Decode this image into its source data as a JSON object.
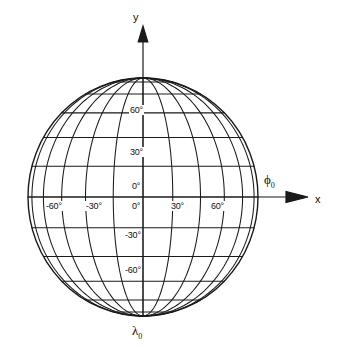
{
  "figure": {
    "title": "",
    "background": "#ffffff",
    "line_color": "#1a1a1a"
  },
  "axes": {
    "x_label": "x",
    "y_label": "y",
    "origin_label": ""
  },
  "symbols": {
    "phi0": "ϕ",
    "phi0_sub": "0",
    "lambda0": "λ",
    "lambda0_sub": "0"
  },
  "meridian_labels": [
    {
      "text": "-60°",
      "value": -60
    },
    {
      "text": "-30°",
      "value": -30
    },
    {
      "text": "0°",
      "value": 0
    },
    {
      "text": "30°",
      "value": 30
    },
    {
      "text": "60°",
      "value": 60
    }
  ],
  "parallel_labels": [
    {
      "text": "60°",
      "value": 60
    },
    {
      "text": "30°",
      "value": 30
    },
    {
      "text": "0°",
      "value": 0
    },
    {
      "text": "-30°",
      "value": -30
    },
    {
      "text": "-60°",
      "value": -60
    }
  ],
  "equator_center_label": "0°",
  "chart_data": {
    "type": "line",
    "xlabel": "x",
    "ylabel": "y",
    "projection": "orthographic",
    "grid": true,
    "legend": false,
    "graticule": {
      "meridian_step_deg": 15,
      "parallel_step_deg": 15,
      "meridian_range_deg": [
        -90,
        90
      ],
      "parallel_range_deg": [
        -90,
        90
      ]
    },
    "center": {
      "x_px": 143,
      "y_px": 197
    },
    "radius": {
      "rx_px": 115,
      "ry_px": 119
    },
    "annotations": [
      {
        "text": "y",
        "x_px": 138,
        "y_px": 18,
        "role": "axis-label"
      },
      {
        "text": "x",
        "x_px": 320,
        "y_px": 200,
        "role": "axis-label"
      },
      {
        "text": "ϕ0",
        "x_px": 268,
        "y_px": 183,
        "role": "central-meridian-longitude"
      },
      {
        "text": "λ0",
        "x_px": 136,
        "y_px": 333,
        "role": "pole-longitude"
      },
      {
        "text": "60°",
        "x_px": 131,
        "y_px": 110,
        "role": "parallel-tick"
      },
      {
        "text": "30°",
        "x_px": 131,
        "y_px": 152,
        "role": "parallel-tick"
      },
      {
        "text": "0°",
        "x_px": 133,
        "y_px": 186,
        "role": "parallel-tick"
      },
      {
        "text": "-30°",
        "x_px": 126,
        "y_px": 235,
        "role": "parallel-tick"
      },
      {
        "text": "-60°",
        "x_px": 126,
        "y_px": 270,
        "role": "parallel-tick"
      },
      {
        "text": "-60°",
        "x_px": 47,
        "y_px": 207,
        "role": "meridian-tick"
      },
      {
        "text": "-30°",
        "x_px": 87,
        "y_px": 207,
        "role": "meridian-tick"
      },
      {
        "text": "0°",
        "x_px": 133,
        "y_px": 207,
        "role": "meridian-tick"
      },
      {
        "text": "30°",
        "x_px": 172,
        "y_px": 207,
        "role": "meridian-tick"
      },
      {
        "text": "60°",
        "x_px": 212,
        "y_px": 207,
        "role": "meridian-tick"
      }
    ]
  }
}
